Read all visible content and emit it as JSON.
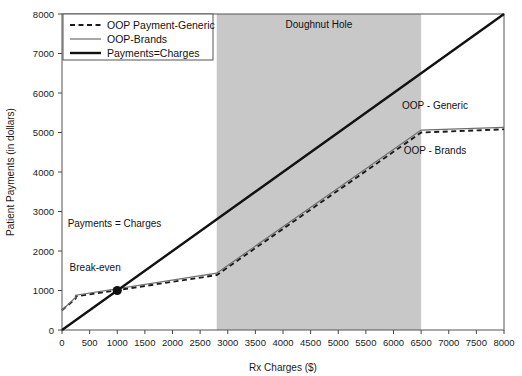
{
  "chart_data": {
    "type": "line",
    "title": "",
    "xlabel": "Rx Charges ($)",
    "ylabel": "Patient Payments (in dollars)",
    "xlim": [
      0,
      8000
    ],
    "ylim": [
      0,
      8000
    ],
    "xticks": [
      0,
      500,
      1000,
      1500,
      2000,
      2500,
      3000,
      3500,
      4000,
      4500,
      5000,
      5500,
      6000,
      6500,
      7000,
      7500,
      8000
    ],
    "yticks": [
      0,
      1000,
      2000,
      3000,
      4000,
      5000,
      6000,
      7000,
      8000
    ],
    "grid": false,
    "legend_position": "top-left",
    "shaded_region": {
      "label": "Doughnut Hole",
      "x_start": 2800,
      "x_end": 6500,
      "color": "#c8c8c8"
    },
    "series": [
      {
        "name": "OOP Payment-Generic",
        "style": "dashed",
        "color": "#1a1a1a",
        "points": [
          [
            0,
            500
          ],
          [
            250,
            800
          ],
          [
            250,
            850
          ],
          [
            2800,
            1390
          ],
          [
            6500,
            5000
          ],
          [
            8000,
            5080
          ]
        ]
      },
      {
        "name": "OOP-Brands",
        "style": "solid-thin",
        "color": "#6e6e6e",
        "points": [
          [
            0,
            500
          ],
          [
            250,
            830
          ],
          [
            250,
            880
          ],
          [
            2800,
            1440
          ],
          [
            6500,
            5060
          ],
          [
            8000,
            5130
          ]
        ]
      },
      {
        "name": "Payments=Charges",
        "style": "solid-thick",
        "color": "#111111",
        "points": [
          [
            0,
            0
          ],
          [
            8000,
            8000
          ]
        ]
      }
    ],
    "annotations": [
      {
        "text": "Doughnut Hole",
        "x": 4650,
        "y": 7650
      },
      {
        "text": "Payments = Charges",
        "x": 950,
        "y": 2600
      },
      {
        "text": "Break-even",
        "x": 600,
        "y": 1500
      },
      {
        "text": "OOP - Generic",
        "x": 6750,
        "y": 5600
      },
      {
        "text": "OOP - Brands",
        "x": 6750,
        "y": 4450
      }
    ],
    "markers": [
      {
        "name": "break-even-point",
        "x": 1000,
        "y": 1000
      }
    ]
  },
  "legend": {
    "items": [
      {
        "label": "OOP Payment-Generic",
        "style": "dashed"
      },
      {
        "label": "OOP-Brands",
        "style": "solid-thin"
      },
      {
        "label": "Payments=Charges",
        "style": "solid-thick"
      }
    ]
  }
}
